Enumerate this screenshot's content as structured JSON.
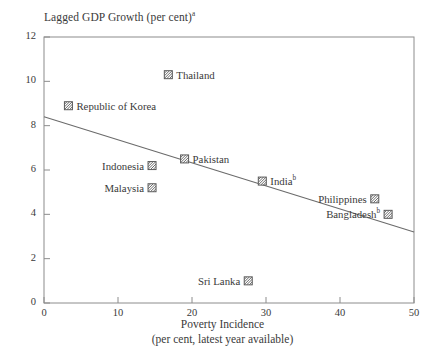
{
  "chart_data": {
    "type": "scatter",
    "title": "Lagged GDP Growth (per cent)",
    "title_footnote": "a",
    "ylabel": "Lagged GDP Growth (per cent)",
    "xlabel": "Poverty Incidence",
    "xlabel_line2": "(per cent, latest year available)",
    "xlim": [
      0,
      50
    ],
    "ylim": [
      0,
      12
    ],
    "xticks": [
      "0",
      "10",
      "20",
      "30",
      "40",
      "50"
    ],
    "yticks": [
      "0",
      "2",
      "4",
      "6",
      "8",
      "10",
      "12"
    ],
    "grid": false,
    "legend": "none",
    "marker_style": "hatched-square",
    "points": [
      {
        "name": "Thailand",
        "footnote": "",
        "x": 16.8,
        "y": 10.3,
        "label_side": "right"
      },
      {
        "name": "Republic of Korea",
        "footnote": "",
        "x": 3.3,
        "y": 8.9,
        "label_side": "right"
      },
      {
        "name": "Pakistan",
        "footnote": "",
        "x": 19.0,
        "y": 6.5,
        "label_side": "right"
      },
      {
        "name": "Indonesia",
        "footnote": "",
        "x": 14.6,
        "y": 6.2,
        "label_side": "left"
      },
      {
        "name": "India",
        "footnote": "b",
        "x": 29.5,
        "y": 5.5,
        "label_side": "right"
      },
      {
        "name": "Malaysia",
        "footnote": "",
        "x": 14.6,
        "y": 5.2,
        "label_side": "left"
      },
      {
        "name": "Philippines",
        "footnote": "",
        "x": 44.7,
        "y": 4.7,
        "label_side": "left"
      },
      {
        "name": "Bangladesh",
        "footnote": "b",
        "x": 46.5,
        "y": 4.0,
        "label_side": "left"
      },
      {
        "name": "Sri Lanka",
        "footnote": "",
        "x": 27.6,
        "y": 1.0,
        "label_side": "left"
      }
    ],
    "trendline": {
      "x0": 0,
      "y0": 8.4,
      "x1": 50,
      "y1": 3.2
    },
    "colors": {
      "axis": "#8c8c8c",
      "text": "#3a3a3a",
      "trendline": "#6b6b6b",
      "marker_stroke": "#5a5a5a",
      "marker_fill": "#ffffff",
      "background": "#ffffff"
    }
  }
}
